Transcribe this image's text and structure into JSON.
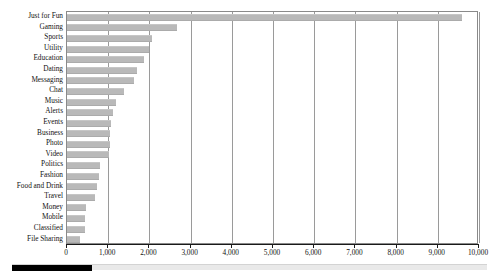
{
  "chart_data": {
    "type": "bar",
    "orientation": "horizontal",
    "title": "",
    "xlabel": "",
    "ylabel": "",
    "xlim": [
      0,
      10000
    ],
    "xticks": [
      0,
      1000,
      2000,
      3000,
      4000,
      5000,
      6000,
      7000,
      8000,
      9000,
      10000
    ],
    "xtick_labels": [
      "0",
      "1,000",
      "2,000",
      "3,000",
      "4,000",
      "5,000",
      "6,000",
      "7,000",
      "8,000",
      "9,000",
      "10,000"
    ],
    "grid": "vertical",
    "legend": "none",
    "bar_color": "#b9b9b9",
    "categories": [
      "Just for Fun",
      "Gaming",
      "Sports",
      "Utility",
      "Education",
      "Dating",
      "Messaging",
      "Chat",
      "Music",
      "Alerts",
      "Events",
      "Business",
      "Photo",
      "Video",
      "Politics",
      "Fashion",
      "Food and Drink",
      "Travel",
      "Money",
      "Mobile",
      "Classified",
      "File Sharing"
    ],
    "values": [
      9590,
      2670,
      2060,
      1990,
      1880,
      1690,
      1620,
      1380,
      1180,
      1120,
      1060,
      1050,
      1040,
      1020,
      790,
      780,
      730,
      680,
      450,
      440,
      430,
      320
    ]
  },
  "scrollbar": {
    "thumb_label": "horizontal-scroll-thumb",
    "position": "left"
  }
}
